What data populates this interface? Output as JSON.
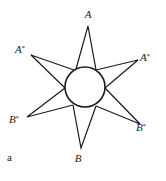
{
  "figure": {
    "panel_label": "a",
    "colors": {
      "stroke": "#1a1a1a",
      "background": "#ffffff"
    },
    "center_circle": {
      "cx": 85,
      "cy": 87,
      "r": 20
    },
    "points": [
      {
        "id": "A_top",
        "label": "A",
        "star": "",
        "tip": [
          88,
          26
        ],
        "base": [
          [
            76,
            69
          ],
          [
            96,
            70
          ]
        ],
        "label_pos": [
          88,
          18
        ]
      },
      {
        "id": "Astar_left",
        "label": "A",
        "star": "*",
        "tip": [
          31,
          55
        ],
        "base": [
          [
            74,
            70
          ],
          [
            65,
            88
          ]
        ],
        "label_pos": [
          20,
          53
        ]
      },
      {
        "id": "Astar_right",
        "label": "A",
        "star": "*",
        "tip": [
          138,
          60
        ],
        "base": [
          [
            96,
            70
          ],
          [
            105,
            88
          ]
        ],
        "label_pos": [
          145,
          61
        ]
      },
      {
        "id": "Bstar_left",
        "label": "B",
        "star": "*",
        "tip": [
          27,
          117
        ],
        "base": [
          [
            65,
            88
          ],
          [
            73,
            105
          ]
        ],
        "label_pos": [
          14,
          123
        ]
      },
      {
        "id": "Bstar_right",
        "label": "B",
        "star": "*",
        "tip": [
          140,
          124
        ],
        "base": [
          [
            105,
            88
          ],
          [
            96,
            106
          ]
        ],
        "label_pos": [
          141,
          131
        ]
      },
      {
        "id": "B_bottom",
        "label": "B",
        "star": "",
        "tip": [
          81,
          148
        ],
        "base": [
          [
            73,
            105
          ],
          [
            96,
            106
          ]
        ],
        "label_pos": [
          78,
          162
        ]
      }
    ]
  }
}
